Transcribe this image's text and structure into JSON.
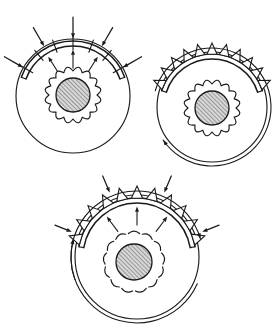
{
  "figure": {
    "background_color": "#ffffff",
    "line_color": "#1a1a1a",
    "hatch_fill_color": "#c9c9c9",
    "width": 279,
    "height": 333,
    "panel_count": 3
  },
  "panels": [
    {
      "id": "panel-a",
      "name": "radial-load-panel",
      "label": "",
      "position": "top-left",
      "center": {
        "x": 73,
        "y": 96
      },
      "outer_radius": 57,
      "band": {
        "inner_radius": 50,
        "outer_radius": 55,
        "arc_start_deg": 200,
        "arc_end_deg": 340,
        "tick_count": 7,
        "description": "double-arc raceway band with short radial tick marks"
      },
      "hub": {
        "center": {
          "x": 73,
          "y": 95
        },
        "hatched_radius": 17,
        "gear_outer_radius": 30,
        "gear_inner_radius": 24,
        "tooth_count": 16,
        "tooth_style": "scalloped-wave",
        "teeth_attached": true,
        "hatch_angle_deg": 45
      },
      "inward_arrows": {
        "count": 5,
        "description": "arrows pointing inward toward the band from outside"
      },
      "outward_arrows": {
        "count": 3,
        "description": "short arrows pointing outward from inside the band"
      },
      "spikes": {
        "count": 0
      },
      "tangential_arrows": {
        "count": 0
      }
    },
    {
      "id": "panel-b",
      "name": "pressure-distribution-panel",
      "label": "",
      "position": "top-right",
      "center": {
        "x": 212,
        "y": 107
      },
      "outer_radius": 55,
      "band": {
        "inner_radius": 48,
        "outer_radius": 53,
        "arc_start_deg": 198,
        "arc_end_deg": 342,
        "tick_count": 0,
        "description": "double-arc raceway band carrying triangular pressure spikes"
      },
      "hub": {
        "center": {
          "x": 212,
          "y": 108
        },
        "hatched_radius": 17,
        "gear_outer_radius": 30,
        "gear_inner_radius": 24,
        "tooth_count": 16,
        "tooth_style": "scalloped-wave",
        "teeth_attached": true,
        "hatch_angle_deg": 45
      },
      "inward_arrows": {
        "count": 0
      },
      "outward_arrows": {
        "count": 0
      },
      "spikes": {
        "count": 11,
        "height": 11,
        "half_width_deg": 5.5,
        "description": "triangular pressure spikes erected normal to the band"
      },
      "tangential_arrows": {
        "count": 1,
        "direction": "counter-clockwise",
        "side": "left",
        "description": "curved tangential arrow on the left flank pointing down-left"
      }
    },
    {
      "id": "panel-c",
      "name": "combined-load-panel",
      "label": "",
      "position": "bottom-center",
      "center": {
        "x": 137,
        "y": 257
      },
      "outer_radius": 62,
      "band": {
        "inner_radius": 54,
        "outer_radius": 59,
        "arc_start_deg": 190,
        "arc_end_deg": 350,
        "tick_count": 0,
        "description": "double-arc raceway band with both spikes and crossing load arrows"
      },
      "hub": {
        "center": {
          "x": 134,
          "y": 262
        },
        "hatched_radius": 18,
        "gear_outer_radius": 32,
        "gear_inner_radius": 26,
        "tooth_count": 13,
        "tooth_style": "detached-crescent",
        "teeth_attached": false,
        "hatch_angle_deg": 45
      },
      "inward_arrows": {
        "count": 4,
        "description": "arrows pointing inward toward the band from outside"
      },
      "outward_arrows": {
        "count": 3,
        "description": "short arrows pointing outward from inside the band"
      },
      "spikes": {
        "count": 11,
        "height": 12,
        "half_width_deg": 5.5,
        "description": "triangular pressure spikes erected normal to the band"
      },
      "tangential_arrows": {
        "count": 2,
        "direction": "counter-clockwise",
        "side": "both",
        "description": "curved tangential arrows on the lower-left and lower-right flanks"
      }
    }
  ]
}
